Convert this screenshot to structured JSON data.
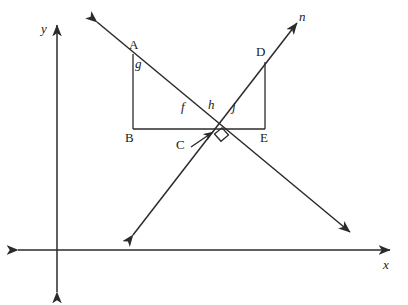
{
  "figure": {
    "stroke_color": "#2b2b2b",
    "background_color": "#ffffff"
  },
  "axes": {
    "x_label": "x",
    "y_label": "y",
    "x_axis_y": 250,
    "y_axis_x": 57,
    "x_axis_left": 18,
    "x_axis_right": 390,
    "y_axis_top": 25,
    "y_axis_bottom": 292,
    "arrows": "double-headed"
  },
  "lines": [
    {
      "name": "line-m",
      "label": "",
      "from": {
        "x": 97,
        "y": 22
      },
      "to": {
        "x": 350,
        "y": 232
      },
      "direction": "upper-left to lower-right",
      "arrowheads": "both"
    },
    {
      "name": "line-n",
      "label": "n",
      "from": {
        "x": 133,
        "y": 235
      },
      "to": {
        "x": 297,
        "y": 23
      },
      "direction": "lower-left to upper-right",
      "arrowheads": "both"
    }
  ],
  "points": [
    {
      "id": "A",
      "label": "A",
      "x": 133,
      "y": 54,
      "label_x": 130,
      "label_y": 40
    },
    {
      "id": "B",
      "label": "B",
      "x": 133,
      "y": 129,
      "label_x": 128,
      "label_y": 134
    },
    {
      "id": "C",
      "label": "C",
      "x": 218,
      "y": 130,
      "label_x": 180,
      "label_y": 140
    },
    {
      "id": "D",
      "label": "D",
      "x": 265,
      "y": 62,
      "label_x": 258,
      "label_y": 48
    },
    {
      "id": "E",
      "label": "E",
      "x": 265,
      "y": 129,
      "label_x": 262,
      "label_y": 134
    }
  ],
  "segments": [
    {
      "name": "segment-AB",
      "from": "A",
      "to": "B"
    },
    {
      "name": "segment-BE",
      "from": "B",
      "to": "E"
    },
    {
      "name": "segment-DE",
      "from": "D",
      "to": "E"
    }
  ],
  "angle_labels": [
    {
      "id": "g",
      "label": "g",
      "x": 137,
      "y": 63
    },
    {
      "id": "f",
      "label": "f",
      "x": 183,
      "y": 105
    },
    {
      "id": "h",
      "label": "h",
      "x": 210,
      "y": 103
    },
    {
      "id": "j",
      "label": "j",
      "x": 234,
      "y": 105
    }
  ],
  "markers": {
    "right_angle": {
      "name": "right-angle-marker",
      "at": {
        "x": 222,
        "y": 136
      },
      "size": 9,
      "description": "small square indicating perpendicular lines at C"
    },
    "leader_line": {
      "name": "c-leader-arrow",
      "from": {
        "x": 192,
        "y": 146
      },
      "to": {
        "x": 214,
        "y": 131
      }
    }
  },
  "intersection": {
    "name": "intersection-point-C",
    "x": 218,
    "y": 130,
    "label": "C"
  }
}
